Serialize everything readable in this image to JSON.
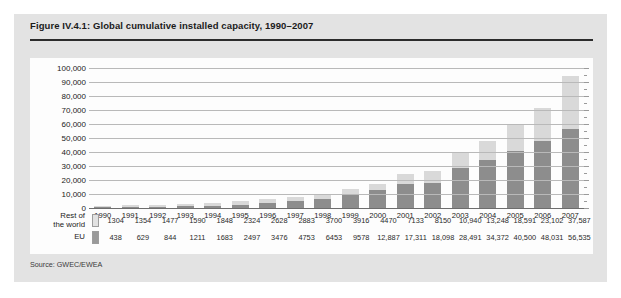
{
  "figure": {
    "title": "Figure IV.4.1: Global cumulative installed capacity, 1990–2007",
    "source": "Source: GWEC/EWEA"
  },
  "legend": {
    "rest_label_line1": "Rest of",
    "rest_label_line2": "the world",
    "eu_label": "EU",
    "rest_color": "#d9d9d9",
    "eu_color": "#8d8d8d"
  },
  "chart_data": {
    "type": "bar",
    "title": "Figure IV.4.1: Global cumulative installed capacity, 1990–2007",
    "xlabel": "",
    "ylabel": "",
    "ylim": [
      0,
      100000
    ],
    "grid": true,
    "stacked": true,
    "legend_position": "left-table",
    "categories": [
      "1990",
      "1991",
      "1992",
      "1993",
      "1994",
      "1995",
      "1996",
      "1997",
      "1998",
      "1999",
      "2000",
      "2001",
      "2002",
      "2003",
      "2004",
      "2005",
      "2006",
      "2007"
    ],
    "ytick_labels": [
      "100,000",
      "90,000",
      "80,000",
      "70,000",
      "60,000",
      "50,000",
      "40,000",
      "30,000",
      "20,000",
      "10,000",
      "0"
    ],
    "ytick_values": [
      100000,
      90000,
      80000,
      70000,
      60000,
      50000,
      40000,
      30000,
      20000,
      10000,
      0
    ],
    "series": [
      {
        "name": "EU",
        "color": "#8d8d8d",
        "values": [
          438,
          629,
          844,
          1211,
          1683,
          2497,
          3476,
          4753,
          6453,
          9578,
          12887,
          17311,
          18098,
          28491,
          34372,
          40500,
          48031,
          56535
        ],
        "labels": [
          "438",
          "629",
          "844",
          "1211",
          "1683",
          "2497",
          "3476",
          "4753",
          "6453",
          "9578",
          "12,887",
          "17,311",
          "18,098",
          "28,491",
          "34,372",
          "40,500",
          "48,031",
          "56,535"
        ]
      },
      {
        "name": "Rest of the world",
        "color": "#d9d9d9",
        "values": [
          1304,
          1354,
          1477,
          1590,
          1848,
          2324,
          2628,
          2883,
          3700,
          3916,
          4470,
          7133,
          8150,
          10940,
          13248,
          18591,
          23102,
          37587
        ],
        "labels": [
          "1304",
          "1354",
          "1477",
          "1590",
          "1848",
          "2324",
          "2628",
          "2883",
          "3700",
          "3916",
          "4470",
          "7133",
          "8150",
          "10,940",
          "13,248",
          "18,591",
          "23,102",
          "37,587"
        ]
      }
    ]
  }
}
